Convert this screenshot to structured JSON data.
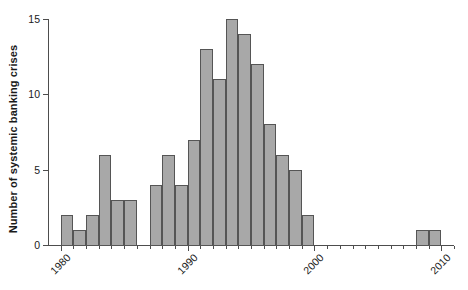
{
  "chart_data": {
    "type": "bar",
    "title": "",
    "subtitle": "",
    "xlabel": "",
    "ylabel": "Number of systemic banking crises",
    "xlim": [
      1979,
      2011
    ],
    "ylim": [
      0,
      15
    ],
    "grid": false,
    "legend": null,
    "bar_style": {
      "fill": "#a8a8a8",
      "edge": "#555555",
      "bin_width_years": 1
    },
    "axis_color": "#4d4d4d",
    "xticks": [
      1980,
      1990,
      2000,
      2010
    ],
    "xtick_labels": [
      "1980",
      "1990",
      "2000",
      "2010"
    ],
    "yticks": [
      0,
      5,
      10,
      15
    ],
    "ytick_labels": [
      "0",
      "5",
      "10",
      "15"
    ],
    "categories": [
      1980,
      1981,
      1982,
      1983,
      1984,
      1985,
      1986,
      1987,
      1988,
      1989,
      1990,
      1991,
      1992,
      1993,
      1994,
      1995,
      1996,
      1997,
      1998,
      1999,
      2000,
      2001,
      2002,
      2003,
      2004,
      2005,
      2006,
      2007,
      2008,
      2009,
      2010
    ],
    "values": [
      2,
      1,
      2,
      6,
      3,
      3,
      0,
      4,
      6,
      4,
      7,
      13,
      11,
      15,
      14,
      12,
      8,
      6,
      5,
      2,
      0,
      0,
      0,
      0,
      0,
      0,
      0,
      0,
      1,
      1,
      0
    ]
  }
}
